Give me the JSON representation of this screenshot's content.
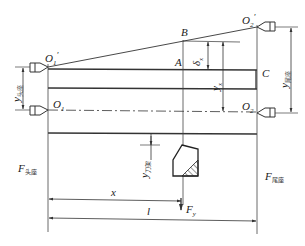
{
  "diagram": {
    "type": "machining deflection diagram (lathe workpiece between centers)",
    "points": {
      "O1_prime": "O1'",
      "O1": "O1",
      "O2_prime": "O2'",
      "O2": "O2",
      "A": "A",
      "B": "B",
      "C": "C"
    },
    "labels": {
      "O1p_main": "O",
      "O1p_sub": "1",
      "O1p_prime": "′",
      "O1_main": "O",
      "O1_sub": "1",
      "O2p_main": "O",
      "O2p_sub": "2",
      "O2p_prime": "′",
      "O2_main": "O",
      "O2_sub": "2",
      "A": "A",
      "B": "B",
      "C": "C",
      "delta_main": "δ",
      "delta_sub": "x",
      "yx_main": "y",
      "yx_sub": "x",
      "y_head_main": "y",
      "y_head_sub": "头座",
      "y_tail_main": "y",
      "y_tail_sub": "尾座",
      "y_tool_main": "y",
      "y_tool_sub": "刀架",
      "F_head_main": "F",
      "F_head_sub": "头座",
      "F_tail_main": "F",
      "F_tail_sub": "尾座",
      "Fy_main": "F",
      "Fy_sub": "y",
      "x_dim": "x",
      "l_dim": "l"
    },
    "colors": {
      "line": "#333333",
      "background": "#ffffff"
    }
  }
}
